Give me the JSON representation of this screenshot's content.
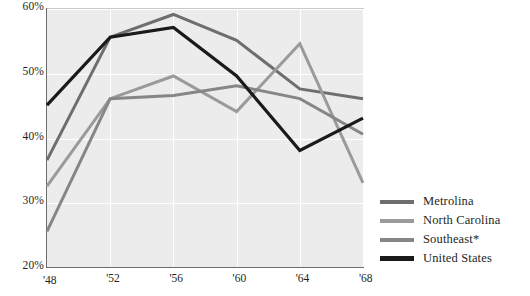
{
  "chart_data": {
    "type": "line",
    "title": "",
    "xlabel": "",
    "ylabel": "",
    "x": [
      "'48",
      "'52",
      "'56",
      "'60",
      "'64",
      "'68"
    ],
    "x_values": [
      1948,
      1952,
      1956,
      1960,
      1964,
      1968
    ],
    "ylim": [
      20,
      60
    ],
    "xlim": [
      1948,
      1968
    ],
    "ytick_labels": [
      "20%",
      "30%",
      "40%",
      "50%",
      "60%"
    ],
    "ytick_values": [
      20,
      30,
      40,
      50,
      60
    ],
    "grid": "both",
    "legend_position": "right",
    "series": [
      {
        "name": "Metrolina",
        "color": "#6e6e6e",
        "values": [
          36.5,
          55.5,
          59.0,
          55.0,
          47.5,
          46.0
        ]
      },
      {
        "name": "North Carolina",
        "color": "#9a9a9a",
        "values": [
          32.5,
          46.0,
          49.5,
          44.0,
          54.5,
          33.0
        ]
      },
      {
        "name": "Southeast*",
        "color": "#868686",
        "values": [
          25.5,
          46.0,
          46.5,
          48.0,
          46.0,
          40.5
        ]
      },
      {
        "name": "United States",
        "color": "#1a1a1a",
        "values": [
          45.0,
          55.5,
          57.0,
          49.5,
          38.0,
          43.0
        ]
      }
    ]
  },
  "legend": {
    "items": [
      {
        "label": "Metrolina"
      },
      {
        "label": "North Carolina"
      },
      {
        "label": "Southeast*"
      },
      {
        "label": "United States"
      }
    ]
  }
}
